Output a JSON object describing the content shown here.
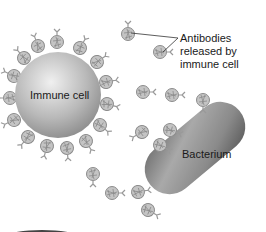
{
  "diagram": {
    "labels": {
      "immune_cell": "Immune cell",
      "bacterium": "Bacterium",
      "callout_line1": "Antibodies",
      "callout_line2": "released by",
      "callout_line3": "immune cell"
    },
    "colors": {
      "background": "#ffffff",
      "cell_light": "#e2e2e2",
      "cell_dark": "#8e8e8e",
      "bacterium_light": "#a8a8a8",
      "bacterium_dark": "#5a5a5a",
      "antibody": "#9a9a9a",
      "text": "#1a1a1a"
    }
  }
}
